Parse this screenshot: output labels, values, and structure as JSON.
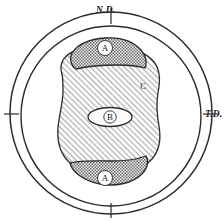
{
  "figure": {
    "background_color": "#ffffff",
    "line_color": "#2b2b2b"
  },
  "axes": {
    "top": {
      "label": "N.D.",
      "tick_name": "top-tick"
    },
    "right": {
      "label": "T.D.",
      "tick_name": "right-tick"
    },
    "left": {
      "label": "",
      "tick_name": "left-tick"
    },
    "bottom": {
      "label": "",
      "tick_name": "bottom-tick"
    }
  },
  "circles": {
    "outer": {
      "name": "outer-boundary-circle",
      "cx": 111,
      "cy": 113,
      "r": 101
    },
    "inner": {
      "name": "inner-boundary-circle",
      "cx": 111,
      "cy": 116,
      "r": 90
    }
  },
  "zones": [
    {
      "id": "zone-c",
      "label": "C",
      "pattern": "diagonal-hatch",
      "fill_color": "#f2f2f2",
      "label_x": 143,
      "label_y": 86
    },
    {
      "id": "zone-a-top",
      "label": "A",
      "pattern": "cross-hatch",
      "fill_color": "#bdbdbd",
      "label_x": 105,
      "label_y": 48
    },
    {
      "id": "zone-a-bottom",
      "label": "A",
      "pattern": "cross-hatch",
      "fill_color": "#bdbdbd",
      "label_x": 105,
      "label_y": 178
    },
    {
      "id": "zone-b",
      "label": "B",
      "pattern": "plain",
      "fill_color": "#fbfbfb",
      "label_x": 110,
      "label_y": 117
    }
  ]
}
